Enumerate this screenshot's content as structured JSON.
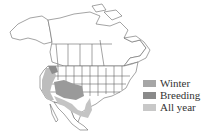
{
  "map": {
    "region": "North America",
    "colors": {
      "land": "#ffffff",
      "border": "#555555",
      "winter": "#a0a0a0",
      "breeding": "#8c8c8c",
      "all_year": "#c4c4c4"
    }
  },
  "legend": {
    "items": [
      {
        "label": "Winter",
        "color": "#a6a6a6"
      },
      {
        "label": "Breeding",
        "color": "#8a8a8a"
      },
      {
        "label": "All year",
        "color": "#c8c8c8"
      }
    ]
  }
}
